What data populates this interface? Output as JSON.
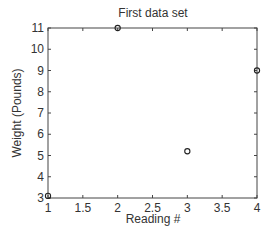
{
  "chart_data": {
    "type": "scatter",
    "title": "First data set",
    "xlabel": "Reading #",
    "ylabel": "Weight (Pounds)",
    "xlim": [
      1,
      4
    ],
    "ylim": [
      3,
      11
    ],
    "xticks": [
      "1",
      "1.5",
      "2",
      "2.5",
      "3",
      "3.5",
      "4"
    ],
    "yticks": [
      "3",
      "4",
      "5",
      "6",
      "7",
      "8",
      "9",
      "10",
      "11"
    ],
    "grid": false,
    "marker": "circle",
    "series": [
      {
        "name": "First data set",
        "x": [
          1,
          2,
          3,
          4
        ],
        "y": [
          3.1,
          11.0,
          5.2,
          9.0
        ]
      }
    ]
  }
}
